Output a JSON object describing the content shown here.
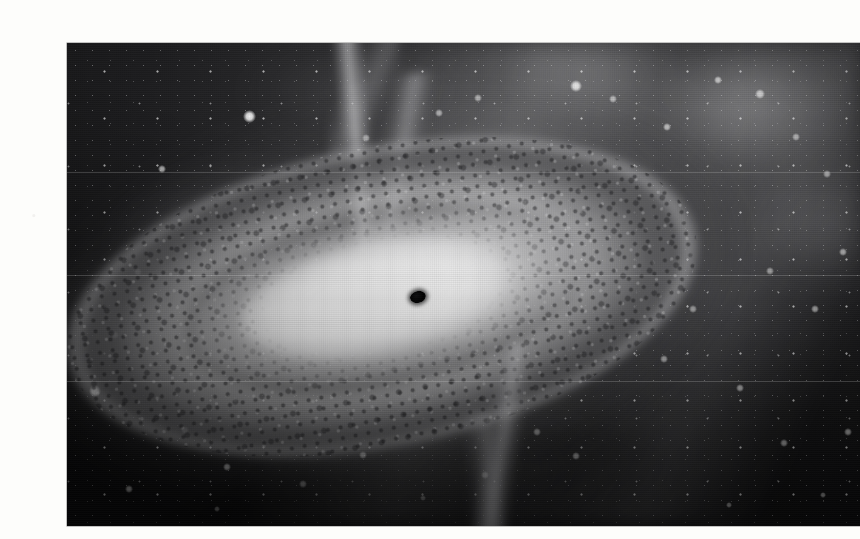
{
  "page": {
    "background_color": "#fdfdfb",
    "width": 846,
    "height": 539
  },
  "artwork": {
    "title": "Supermassive black hole with accretion disk and bipolar relativistic jets",
    "alt_text": "Artist's illustration of a black hole at the center of a glowing accretion disk, with narrow jets shooting out above and below, set against a dusty star field",
    "medium": "grayscale halftone print illustration",
    "frame": {
      "left": 27,
      "top": 27,
      "width": 793,
      "height": 483
    },
    "palette": {
      "space_dark": "#0a0a0b",
      "space_mid": "#303032",
      "nebula_grey": "#8c8c8f",
      "disk_mid": "#c6c6c7",
      "disk_bright": "#ffffff",
      "dust_lane": "#16161a",
      "jet_grey": "#c4c4c7",
      "event_horizon": "#000000"
    },
    "elements": [
      {
        "name": "event-horizon",
        "label": "Black hole event horizon",
        "cx": 351,
        "cy": 254,
        "rx": 8,
        "ry": 6
      },
      {
        "name": "accretion-disk",
        "label": "Accretion disk",
        "cx": 315,
        "cy": 254,
        "tilt_deg": -11.5
      },
      {
        "name": "jet-upper",
        "label": "Upper relativistic jet"
      },
      {
        "name": "jet-lower",
        "label": "Lower relativistic jet"
      },
      {
        "name": "dust-lane",
        "label": "Dark dust lane ring"
      },
      {
        "name": "starfield",
        "label": "Background star field"
      },
      {
        "name": "nebula-bands",
        "label": "Diffuse nebula bands"
      }
    ],
    "bright_stars": [
      {
        "x": 182,
        "y": 73,
        "size": 5.0,
        "glow": 0.95
      },
      {
        "x": 95,
        "y": 126,
        "size": 3.4,
        "glow": 0.7
      },
      {
        "x": 330,
        "y": 126,
        "size": 3.2,
        "glow": 0.7
      },
      {
        "x": 299,
        "y": 95,
        "size": 3.0,
        "glow": 0.62
      },
      {
        "x": 372,
        "y": 70,
        "size": 3.0,
        "glow": 0.6
      },
      {
        "x": 411,
        "y": 55,
        "size": 2.8,
        "glow": 0.58
      },
      {
        "x": 509,
        "y": 43,
        "size": 4.4,
        "glow": 0.85
      },
      {
        "x": 546,
        "y": 56,
        "size": 3.0,
        "glow": 0.6
      },
      {
        "x": 600,
        "y": 84,
        "size": 3.2,
        "glow": 0.64
      },
      {
        "x": 651,
        "y": 37,
        "size": 3.4,
        "glow": 0.68
      },
      {
        "x": 693,
        "y": 51,
        "size": 3.6,
        "glow": 0.72
      },
      {
        "x": 729,
        "y": 94,
        "size": 3.0,
        "glow": 0.58
      },
      {
        "x": 760,
        "y": 131,
        "size": 2.8,
        "glow": 0.55
      },
      {
        "x": 776,
        "y": 209,
        "size": 3.2,
        "glow": 0.62
      },
      {
        "x": 748,
        "y": 266,
        "size": 3.0,
        "glow": 0.58
      },
      {
        "x": 703,
        "y": 228,
        "size": 2.8,
        "glow": 0.52
      },
      {
        "x": 626,
        "y": 266,
        "size": 2.8,
        "glow": 0.52
      },
      {
        "x": 597,
        "y": 316,
        "size": 3.0,
        "glow": 0.56
      },
      {
        "x": 673,
        "y": 345,
        "size": 3.0,
        "glow": 0.58
      },
      {
        "x": 717,
        "y": 400,
        "size": 2.8,
        "glow": 0.52
      },
      {
        "x": 781,
        "y": 389,
        "size": 3.0,
        "glow": 0.56
      },
      {
        "x": 756,
        "y": 452,
        "size": 2.6,
        "glow": 0.48
      },
      {
        "x": 509,
        "y": 413,
        "size": 3.2,
        "glow": 0.6
      },
      {
        "x": 470,
        "y": 389,
        "size": 2.8,
        "glow": 0.52
      },
      {
        "x": 418,
        "y": 432,
        "size": 3.0,
        "glow": 0.56
      },
      {
        "x": 356,
        "y": 455,
        "size": 2.6,
        "glow": 0.48
      },
      {
        "x": 296,
        "y": 412,
        "size": 3.2,
        "glow": 0.62
      },
      {
        "x": 236,
        "y": 441,
        "size": 2.8,
        "glow": 0.52
      },
      {
        "x": 160,
        "y": 424,
        "size": 3.0,
        "glow": 0.56
      },
      {
        "x": 118,
        "y": 387,
        "size": 2.8,
        "glow": 0.52
      },
      {
        "x": 62,
        "y": 446,
        "size": 3.0,
        "glow": 0.56
      },
      {
        "x": 28,
        "y": 348,
        "size": 4.6,
        "glow": 0.88
      },
      {
        "x": 48,
        "y": 292,
        "size": 3.0,
        "glow": 0.58
      },
      {
        "x": 71,
        "y": 229,
        "size": 2.8,
        "glow": 0.5
      },
      {
        "x": 150,
        "y": 466,
        "size": 2.6,
        "glow": 0.46
      },
      {
        "x": 662,
        "y": 462,
        "size": 2.6,
        "glow": 0.46
      }
    ]
  }
}
